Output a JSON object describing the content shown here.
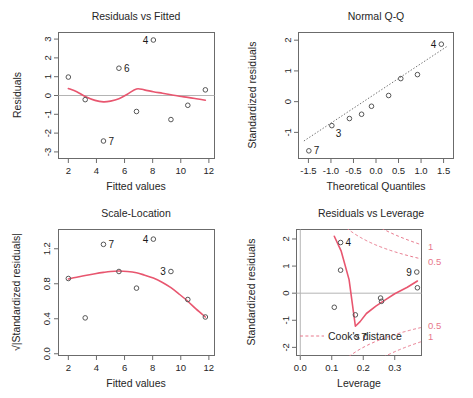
{
  "figure": {
    "kind": "r-regression-diagnostic-plots",
    "rows": 2,
    "columns": 2,
    "point_color": "#565656",
    "accent_color": "#e8566f",
    "cook_color": "#e8788c",
    "reference_line_color": "#b4b4b4"
  },
  "chart_data": [
    {
      "type": "scatter",
      "panel": "top-left",
      "title": "Residuals vs Fitted",
      "xlabel": "Fitted values",
      "ylabel": "Residuals",
      "xlim": [
        1.3,
        12.4
      ],
      "ylim": [
        -3.35,
        3.35
      ],
      "xticks": [
        2,
        4,
        6,
        8,
        10,
        12
      ],
      "xtick_labels": [
        "2",
        "4",
        "6",
        "8",
        "10",
        "12"
      ],
      "yticks": [
        -3,
        -2,
        -1,
        0,
        1,
        2,
        3
      ],
      "ytick_labels": [
        "-3",
        "-2",
        "-1",
        "0",
        "1",
        "2",
        "3"
      ],
      "grid": false,
      "legend": "none",
      "reference_line": {
        "type": "horizontal",
        "y": 0
      },
      "x": [
        2.0,
        3.2,
        4.5,
        5.6,
        6.85,
        8.05,
        9.3,
        10.5,
        11.75
      ],
      "y": [
        0.98,
        -0.22,
        -2.42,
        1.45,
        -0.85,
        2.95,
        -1.28,
        -0.52,
        0.3
      ],
      "point_labels": [
        {
          "label": "4",
          "x": 8.05,
          "y": 2.95,
          "side": "left"
        },
        {
          "label": "6",
          "x": 5.6,
          "y": 1.45,
          "side": "right"
        },
        {
          "label": "7",
          "x": 4.5,
          "y": -2.42,
          "side": "right"
        }
      ],
      "smoother": {
        "name": "loess",
        "x": [
          2.0,
          2.6,
          3.2,
          3.9,
          4.5,
          5.0,
          5.6,
          6.2,
          6.85,
          7.4,
          8.05,
          8.7,
          9.3,
          9.9,
          10.5,
          11.1,
          11.75
        ],
        "y": [
          0.37,
          0.2,
          -0.05,
          -0.26,
          -0.34,
          -0.3,
          -0.17,
          0.07,
          0.35,
          0.3,
          0.2,
          0.12,
          0.04,
          -0.04,
          -0.1,
          -0.17,
          -0.25
        ]
      }
    },
    {
      "type": "scatter",
      "panel": "top-right",
      "title": "Normal Q-Q",
      "xlabel": "Theoretical Quantiles",
      "ylabel": "Standardized residuals",
      "xlim": [
        -1.72,
        1.72
      ],
      "ylim": [
        -1.85,
        2.25
      ],
      "xticks": [
        -1.5,
        -1.0,
        -0.5,
        0.0,
        0.5,
        1.0,
        1.5
      ],
      "xtick_labels": [
        "-1.5",
        "-1.0",
        "-0.5",
        "0.0",
        "0.5",
        "1.0",
        "1.5"
      ],
      "yticks": [
        -1,
        0,
        1,
        2
      ],
      "ytick_labels": [
        "-1",
        "0",
        "1",
        "2"
      ],
      "grid": false,
      "legend": "none",
      "reference_line": {
        "type": "qq-dotted",
        "from": [
          -1.6,
          -1.28
        ],
        "to": [
          1.6,
          1.82
        ]
      },
      "x": [
        -1.49,
        -0.98,
        -0.59,
        -0.32,
        -0.1,
        0.28,
        0.55,
        0.92,
        1.45
      ],
      "y": [
        -1.6,
        -0.78,
        -0.55,
        -0.41,
        -0.15,
        0.2,
        0.75,
        0.88,
        1.87
      ],
      "point_labels": [
        {
          "label": "4",
          "x": 1.45,
          "y": 1.87,
          "side": "left"
        },
        {
          "label": "3",
          "x": -0.98,
          "y": -0.78,
          "side": "below-right"
        },
        {
          "label": "7",
          "x": -1.49,
          "y": -1.6,
          "side": "right"
        }
      ]
    },
    {
      "type": "scatter",
      "panel": "bottom-left",
      "title": "Scale-Location",
      "xlabel": "Fitted values",
      "ylabel": "√|Standardized residuals|",
      "xlim": [
        1.3,
        12.4
      ],
      "ylim": [
        -0.02,
        1.42
      ],
      "xticks": [
        2,
        4,
        6,
        8,
        10,
        12
      ],
      "xtick_labels": [
        "2",
        "4",
        "6",
        "8",
        "10",
        "12"
      ],
      "yticks": [
        0.0,
        0.4,
        0.8,
        1.2
      ],
      "ytick_labels": [
        "0.0",
        "0.4",
        "0.8",
        "1.2"
      ],
      "grid": false,
      "legend": "none",
      "x": [
        2.0,
        3.2,
        4.5,
        5.6,
        6.85,
        8.05,
        9.3,
        10.5,
        11.75
      ],
      "y": [
        0.86,
        0.41,
        1.25,
        0.94,
        0.75,
        1.31,
        0.94,
        0.62,
        0.42
      ],
      "point_labels": [
        {
          "label": "7",
          "x": 4.5,
          "y": 1.25,
          "side": "right"
        },
        {
          "label": "4",
          "x": 8.05,
          "y": 1.31,
          "side": "left"
        },
        {
          "label": "3",
          "x": 9.3,
          "y": 0.94,
          "side": "left"
        }
      ],
      "smoother": {
        "name": "loess",
        "x": [
          2.0,
          2.6,
          3.2,
          3.9,
          4.5,
          5.0,
          5.6,
          6.2,
          6.85,
          7.4,
          8.05,
          8.7,
          9.3,
          9.9,
          10.5,
          11.1,
          11.75
        ],
        "y": [
          0.855,
          0.875,
          0.895,
          0.915,
          0.93,
          0.94,
          0.945,
          0.94,
          0.925,
          0.9,
          0.865,
          0.815,
          0.755,
          0.68,
          0.6,
          0.51,
          0.42
        ]
      }
    },
    {
      "type": "scatter",
      "panel": "bottom-right",
      "title": "Residuals vs Leverage",
      "xlabel": "Leverage",
      "ylabel": "Standardized residuals",
      "xlim": [
        -0.012,
        0.385
      ],
      "ylim": [
        -2.3,
        2.35
      ],
      "xticks": [
        0.0,
        0.1,
        0.2,
        0.3
      ],
      "xtick_labels": [
        "0.0",
        "0.1",
        "0.2",
        "0.3"
      ],
      "yticks": [
        -2,
        -1,
        0,
        1,
        2
      ],
      "ytick_labels": [
        "-2",
        "-1",
        "0",
        "1",
        "2"
      ],
      "grid": false,
      "legend": "Cook's distance",
      "legend_position": "bottom-left",
      "reference_lines": [
        {
          "type": "horizontal",
          "y": 0
        },
        {
          "type": "vertical",
          "x": 0.0
        }
      ],
      "x": [
        0.108,
        0.128,
        0.175,
        0.178,
        0.255,
        0.258,
        0.37,
        0.372,
        0.128
      ],
      "y": [
        -0.52,
        1.87,
        -0.8,
        -1.62,
        -0.18,
        -0.3,
        0.78,
        0.2,
        0.85
      ],
      "point_labels": [
        {
          "label": "4",
          "x": 0.128,
          "y": 1.87,
          "side": "right"
        },
        {
          "label": "7",
          "x": 0.178,
          "y": -1.62,
          "side": "right"
        },
        {
          "label": "9",
          "x": 0.37,
          "y": 0.78,
          "side": "left"
        }
      ],
      "cook_contour_labels": [
        {
          "label": "1",
          "y": 1.72
        },
        {
          "label": "0.5",
          "y": 1.18
        },
        {
          "label": "0.5",
          "y": -1.18
        },
        {
          "label": "1",
          "y": -1.6
        }
      ],
      "smoother": {
        "name": "loess",
        "x": [
          0.108,
          0.13,
          0.155,
          0.175,
          0.19,
          0.21,
          0.24,
          0.27,
          0.3,
          0.34,
          0.372
        ],
        "y": [
          2.1,
          1.55,
          0.5,
          -1.22,
          -1.05,
          -0.75,
          -0.48,
          -0.25,
          -0.02,
          0.22,
          0.45
        ]
      }
    }
  ]
}
